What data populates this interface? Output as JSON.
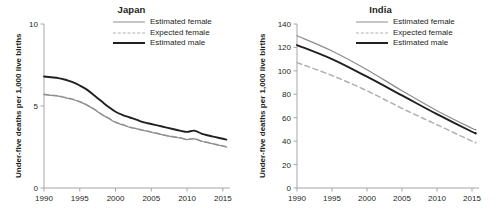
{
  "figure": {
    "ylabel": "Under-five deaths per 1,000 live births",
    "legend": {
      "estimated_female": "Estimated female",
      "expected_female": "Expected female",
      "estimated_male": "Estimated male"
    },
    "colors": {
      "estimated_female": "#8d8d8d",
      "expected_female": "#b0b0b0",
      "estimated_male": "#231f20",
      "axis": "#a6a6a6",
      "text": "#231f20"
    }
  },
  "chart_data": [
    {
      "type": "line",
      "title": "Japan",
      "xlabel": "",
      "ylabel": "Under-five deaths per 1,000 live births",
      "xlim": [
        1990,
        2016
      ],
      "ylim": [
        0,
        10
      ],
      "xticks": [
        1990,
        1995,
        2000,
        2005,
        2010,
        2015
      ],
      "xtick_labels": [
        "1990",
        "1995",
        "2000",
        "2005",
        "2010",
        "2015"
      ],
      "yticks": [
        0,
        5,
        10
      ],
      "ytick_labels": [
        "0",
        "5",
        "10"
      ],
      "grid": false,
      "legend_position": "top-right",
      "x": [
        1990,
        1991,
        1992,
        1993,
        1994,
        1995,
        1996,
        1997,
        1998,
        1999,
        2000,
        2001,
        2002,
        2003,
        2004,
        2005,
        2006,
        2007,
        2008,
        2009,
        2010,
        2011,
        2012,
        2013,
        2014,
        2015,
        2015.5
      ],
      "series": [
        {
          "name": "Estimated female",
          "style": "solid",
          "color": "#8d8d8d",
          "values": [
            5.7,
            5.65,
            5.6,
            5.5,
            5.4,
            5.25,
            5.05,
            4.8,
            4.5,
            4.25,
            4.0,
            3.85,
            3.7,
            3.6,
            3.5,
            3.4,
            3.3,
            3.2,
            3.12,
            3.05,
            2.95,
            3.0,
            2.85,
            2.75,
            2.65,
            2.55,
            2.5
          ]
        },
        {
          "name": "Expected female",
          "style": "dashed",
          "color": "#b0b0b0",
          "values": [
            5.72,
            5.67,
            5.62,
            5.52,
            5.42,
            5.27,
            5.07,
            4.82,
            4.52,
            4.27,
            4.02,
            3.87,
            3.72,
            3.62,
            3.52,
            3.42,
            3.32,
            3.22,
            3.14,
            3.07,
            2.97,
            3.02,
            2.87,
            2.77,
            2.67,
            2.57,
            2.52
          ]
        },
        {
          "name": "Estimated male",
          "style": "solid-thick",
          "color": "#231f20",
          "values": [
            6.8,
            6.75,
            6.7,
            6.6,
            6.45,
            6.25,
            6.0,
            5.65,
            5.3,
            4.95,
            4.65,
            4.45,
            4.3,
            4.15,
            4.0,
            3.9,
            3.8,
            3.7,
            3.6,
            3.5,
            3.42,
            3.5,
            3.32,
            3.2,
            3.1,
            3.0,
            2.95
          ]
        }
      ]
    },
    {
      "type": "line",
      "title": "India",
      "xlabel": "",
      "ylabel": "Under-five deaths per 1,000 live births",
      "xlim": [
        1990,
        2016
      ],
      "ylim": [
        0,
        140
      ],
      "xticks": [
        1990,
        1995,
        2000,
        2005,
        2010,
        2015
      ],
      "xtick_labels": [
        "1990",
        "1995",
        "2000",
        "2005",
        "2010",
        "2015"
      ],
      "yticks": [
        0,
        20,
        40,
        60,
        80,
        100,
        120,
        140
      ],
      "ytick_labels": [
        "0",
        "20",
        "40",
        "60",
        "80",
        "100",
        "120",
        "140"
      ],
      "grid": false,
      "legend_position": "top-right",
      "x": [
        1990,
        1995,
        2000,
        2005,
        2010,
        2015,
        2015.5
      ],
      "series": [
        {
          "name": "Estimated female",
          "style": "solid",
          "color": "#8d8d8d",
          "values": [
            130,
            117,
            101,
            83,
            66,
            51,
            50
          ]
        },
        {
          "name": "Expected female",
          "style": "dashed",
          "color": "#b0b0b0",
          "values": [
            107,
            96,
            83,
            68,
            54,
            40,
            39
          ]
        },
        {
          "name": "Estimated male",
          "style": "solid-thick",
          "color": "#231f20",
          "values": [
            122,
            110,
            95,
            79,
            63,
            48,
            47
          ]
        }
      ]
    }
  ]
}
